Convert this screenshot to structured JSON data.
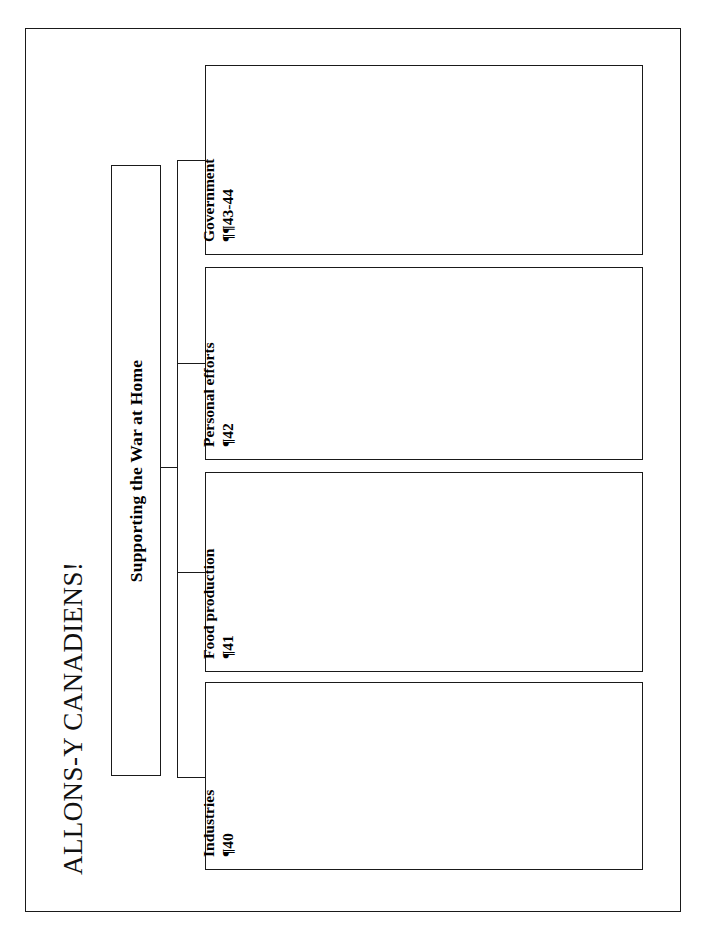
{
  "document": {
    "title": "ALLONS-Y CANADIENS!",
    "root": {
      "label": "Supporting the War at Home"
    },
    "branches": [
      {
        "title": "Government",
        "reference": "¶¶43-44"
      },
      {
        "title": "Personal efforts",
        "reference": "¶42"
      },
      {
        "title": "Food production",
        "reference": "¶41"
      },
      {
        "title": "Industries",
        "reference": "¶40"
      }
    ]
  },
  "style": {
    "ink": "#1a1a1a",
    "paper": "#ffffff"
  }
}
